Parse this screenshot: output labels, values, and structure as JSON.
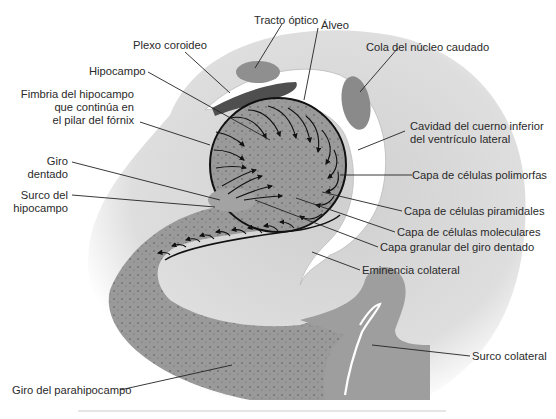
{
  "figure": {
    "type": "anatomical-diagram",
    "colors": {
      "background": "#ffffff",
      "halo": "#d8d8d8",
      "tissue": "#9a9a9a",
      "tissue_dark": "#7d7d7d",
      "choroid_plexus": "#5a5a5a",
      "ventricle": "#ffffff",
      "outline": "#111111",
      "leader": "#222222",
      "text": "#2a2a2a"
    }
  },
  "labels": {
    "tracto_optico": "Tracto óptico",
    "alveo": "Álveo",
    "plexo_coroideo": "Plexo coroideo",
    "cola_nucleo_caudado": "Cola del núcleo caudado",
    "hipocampo": "Hipocampo",
    "fimbria_l1": "Fimbria del hipocampo",
    "fimbria_l2": "que continúa en",
    "fimbria_l3": "el pilar del fórnix",
    "cavidad_l1": "Cavidad del cuerno inferior",
    "cavidad_l2": "del ventrículo lateral",
    "capa_polimorfas": "Capa de células polimorfas",
    "giro_dentado_l1": "Giro",
    "giro_dentado_l2": "dentado",
    "surco_hipocampo_l1": "Surco del",
    "surco_hipocampo_l2": "hipocampo",
    "capa_piramidales": "Capa de células piramidales",
    "capa_moleculares": "Capa de células moleculares",
    "capa_granular": "Capa granular del giro dentado",
    "eminencia_colateral": "Eminencia colateral",
    "surco_colateral": "Surco colateral",
    "giro_parahipocampo": "Giro del parahipocampo"
  }
}
